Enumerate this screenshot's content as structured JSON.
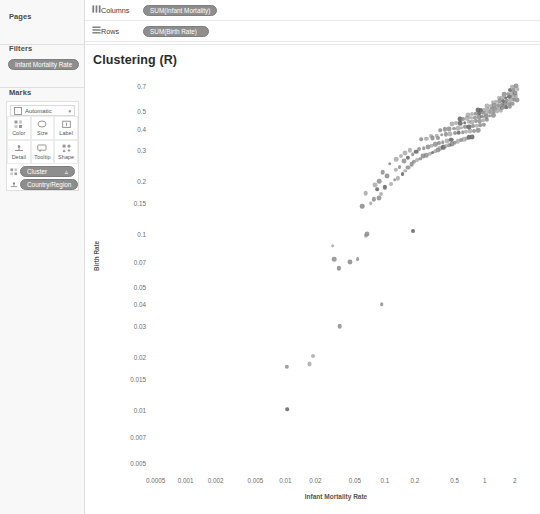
{
  "panel": {
    "pages": {
      "title": "Pages"
    },
    "filters": {
      "title": "Filters",
      "pill": "Infant Mortality Rate"
    },
    "marks": {
      "title": "Marks",
      "type": "Automatic",
      "caret": "▾",
      "buttons": [
        {
          "name": "color",
          "label": "Color",
          "icon": "color-icon"
        },
        {
          "name": "size",
          "label": "Size",
          "icon": "size-icon"
        },
        {
          "name": "label",
          "label": "Label",
          "icon": "label-icon"
        },
        {
          "name": "detail",
          "label": "Detail",
          "icon": "detail-icon"
        },
        {
          "name": "tooltip",
          "label": "Tooltip",
          "icon": "tooltip-icon"
        },
        {
          "name": "shape",
          "label": "Shape",
          "icon": "shape-icon"
        }
      ],
      "encodings": [
        {
          "label": "Cluster",
          "icon": "color-icon",
          "badge": "▵"
        },
        {
          "label": "Country/Region",
          "icon": "detail-icon",
          "badge": ""
        }
      ]
    }
  },
  "shelves": {
    "columns": {
      "label": "Columns",
      "icon": "columns-icon",
      "pill": "SUM(Infant Mortality)"
    },
    "rows": {
      "label": "Rows",
      "icon": "rows-icon",
      "pill": "SUM(Birth Rate)"
    }
  },
  "viz": {
    "title": "Clustering (R)"
  },
  "colors": {
    "pill": "#8e8e8e",
    "point": "#8a8a8a",
    "point_dark": "#5e5e5e",
    "panel": "#f8f8f8"
  },
  "chart_data": {
    "type": "scatter",
    "title": "Clustering (R)",
    "xlabel": "Infant Mortality Rate",
    "ylabel": "Birth Rate",
    "xscale": "log",
    "yscale": "log",
    "xlim": [
      0.0004,
      2.6
    ],
    "ylim": [
      0.0045,
      0.85
    ],
    "grid": false,
    "legend": false,
    "xticks": [
      0.0005,
      0.001,
      0.002,
      0.005,
      0.01,
      0.02,
      0.05,
      0.1,
      0.2,
      0.5,
      1,
      2
    ],
    "xticklabels": [
      "0.0005",
      "0.001",
      "0.002",
      "0.005",
      "0.01",
      "0.02",
      "0.05",
      "0.1",
      "0.2",
      "0.5",
      "1",
      "2"
    ],
    "yticks": [
      0.7,
      0.5,
      0.4,
      0.3,
      0.2,
      0.15,
      0.1,
      0.07,
      0.05,
      0.04,
      0.03,
      0.02,
      0.015,
      0.01,
      0.007,
      0.005
    ],
    "yticklabels": [
      "0.7",
      "0.5",
      "0.4",
      "0.3",
      "0.2",
      "0.15",
      "0.1",
      "0.07",
      "0.05",
      "0.04",
      "0.03",
      "0.02",
      "0.015",
      "0.01",
      "0.007",
      "0.005"
    ],
    "points": [
      [
        0.0105,
        0.0101
      ],
      [
        0.0104,
        0.0176
      ],
      [
        0.0175,
        0.0183
      ],
      [
        0.019,
        0.0203
      ],
      [
        0.035,
        0.03
      ],
      [
        0.093,
        0.04
      ],
      [
        0.0345,
        0.064
      ],
      [
        0.045,
        0.07
      ],
      [
        0.053,
        0.072
      ],
      [
        0.031,
        0.072
      ],
      [
        0.03,
        0.086
      ],
      [
        0.064,
        0.098
      ],
      [
        0.066,
        0.1
      ],
      [
        0.19,
        0.105
      ],
      [
        0.059,
        0.145
      ],
      [
        0.072,
        0.15
      ],
      [
        0.078,
        0.158
      ],
      [
        0.087,
        0.16
      ],
      [
        0.092,
        0.17
      ],
      [
        0.064,
        0.172
      ],
      [
        0.084,
        0.18
      ],
      [
        0.1,
        0.185
      ],
      [
        0.079,
        0.19
      ],
      [
        0.115,
        0.193
      ],
      [
        0.088,
        0.2
      ],
      [
        0.125,
        0.205
      ],
      [
        0.135,
        0.208
      ],
      [
        0.105,
        0.215
      ],
      [
        0.15,
        0.22
      ],
      [
        0.095,
        0.225
      ],
      [
        0.16,
        0.23
      ],
      [
        0.128,
        0.233
      ],
      [
        0.172,
        0.24
      ],
      [
        0.14,
        0.242
      ],
      [
        0.185,
        0.25
      ],
      [
        0.112,
        0.252
      ],
      [
        0.195,
        0.258
      ],
      [
        0.155,
        0.26
      ],
      [
        0.21,
        0.265
      ],
      [
        0.13,
        0.268
      ],
      [
        0.225,
        0.27
      ],
      [
        0.17,
        0.272
      ],
      [
        0.24,
        0.278
      ],
      [
        0.145,
        0.28
      ],
      [
        0.26,
        0.282
      ],
      [
        0.19,
        0.285
      ],
      [
        0.28,
        0.288
      ],
      [
        0.16,
        0.29
      ],
      [
        0.3,
        0.292
      ],
      [
        0.205,
        0.295
      ],
      [
        0.32,
        0.298
      ],
      [
        0.178,
        0.3
      ],
      [
        0.34,
        0.302
      ],
      [
        0.22,
        0.305
      ],
      [
        0.36,
        0.308
      ],
      [
        0.245,
        0.31
      ],
      [
        0.385,
        0.312
      ],
      [
        0.27,
        0.315
      ],
      [
        0.41,
        0.318
      ],
      [
        0.295,
        0.32
      ],
      [
        0.44,
        0.322
      ],
      [
        0.32,
        0.325
      ],
      [
        0.47,
        0.328
      ],
      [
        0.35,
        0.33
      ],
      [
        0.5,
        0.332
      ],
      [
        0.38,
        0.335
      ],
      [
        0.54,
        0.338
      ],
      [
        0.42,
        0.34
      ],
      [
        0.58,
        0.342
      ],
      [
        0.46,
        0.345
      ],
      [
        0.23,
        0.348
      ],
      [
        0.26,
        0.35
      ],
      [
        0.3,
        0.352
      ],
      [
        0.34,
        0.355
      ],
      [
        0.62,
        0.348
      ],
      [
        0.66,
        0.352
      ],
      [
        0.7,
        0.356
      ],
      [
        0.75,
        0.36
      ],
      [
        0.29,
        0.362
      ],
      [
        0.33,
        0.365
      ],
      [
        0.37,
        0.368
      ],
      [
        0.41,
        0.37
      ],
      [
        0.45,
        0.372
      ],
      [
        0.5,
        0.375
      ],
      [
        0.55,
        0.378
      ],
      [
        0.6,
        0.38
      ],
      [
        0.65,
        0.382
      ],
      [
        0.72,
        0.385
      ],
      [
        0.79,
        0.388
      ],
      [
        0.86,
        0.39
      ],
      [
        0.36,
        0.392
      ],
      [
        0.4,
        0.395
      ],
      [
        0.44,
        0.398
      ],
      [
        0.49,
        0.4
      ],
      [
        0.54,
        0.402
      ],
      [
        0.59,
        0.405
      ],
      [
        0.64,
        0.408
      ],
      [
        0.7,
        0.41
      ],
      [
        0.76,
        0.412
      ],
      [
        0.83,
        0.415
      ],
      [
        0.9,
        0.418
      ],
      [
        0.98,
        0.42
      ],
      [
        0.47,
        0.425
      ],
      [
        0.52,
        0.428
      ],
      [
        0.57,
        0.43
      ],
      [
        0.63,
        0.432
      ],
      [
        0.69,
        0.435
      ],
      [
        0.75,
        0.438
      ],
      [
        0.82,
        0.44
      ],
      [
        0.89,
        0.442
      ],
      [
        0.97,
        0.445
      ],
      [
        1.05,
        0.448
      ],
      [
        0.56,
        0.452
      ],
      [
        0.61,
        0.455
      ],
      [
        0.67,
        0.458
      ],
      [
        0.73,
        0.46
      ],
      [
        0.8,
        0.462
      ],
      [
        0.87,
        0.465
      ],
      [
        0.95,
        0.468
      ],
      [
        1.03,
        0.47
      ],
      [
        1.12,
        0.472
      ],
      [
        1.22,
        0.475
      ],
      [
        0.68,
        0.48
      ],
      [
        0.74,
        0.482
      ],
      [
        0.81,
        0.485
      ],
      [
        0.88,
        0.488
      ],
      [
        0.96,
        0.49
      ],
      [
        1.04,
        0.492
      ],
      [
        1.13,
        0.495
      ],
      [
        1.23,
        0.498
      ],
      [
        1.34,
        0.5
      ],
      [
        1.45,
        0.502
      ],
      [
        0.85,
        0.508
      ],
      [
        0.92,
        0.51
      ],
      [
        1.0,
        0.512
      ],
      [
        1.09,
        0.515
      ],
      [
        1.18,
        0.518
      ],
      [
        1.28,
        0.52
      ],
      [
        1.39,
        0.522
      ],
      [
        1.51,
        0.525
      ],
      [
        1.64,
        0.528
      ],
      [
        1.78,
        0.53
      ],
      [
        1.06,
        0.538
      ],
      [
        1.15,
        0.54
      ],
      [
        1.25,
        0.542
      ],
      [
        1.36,
        0.545
      ],
      [
        1.48,
        0.548
      ],
      [
        1.6,
        0.55
      ],
      [
        1.74,
        0.552
      ],
      [
        1.89,
        0.555
      ],
      [
        1.2,
        0.565
      ],
      [
        1.3,
        0.568
      ],
      [
        1.41,
        0.57
      ],
      [
        1.53,
        0.572
      ],
      [
        1.66,
        0.575
      ],
      [
        1.8,
        0.578
      ],
      [
        1.95,
        0.58
      ],
      [
        2.1,
        0.582
      ],
      [
        1.38,
        0.595
      ],
      [
        1.5,
        0.598
      ],
      [
        1.63,
        0.6
      ],
      [
        1.77,
        0.605
      ],
      [
        1.92,
        0.608
      ],
      [
        2.08,
        0.61
      ],
      [
        1.58,
        0.625
      ],
      [
        1.72,
        0.63
      ],
      [
        1.87,
        0.635
      ],
      [
        2.03,
        0.64
      ],
      [
        1.8,
        0.66
      ],
      [
        1.96,
        0.665
      ],
      [
        2.15,
        0.67
      ],
      [
        1.9,
        0.69
      ],
      [
        2.05,
        0.695
      ]
    ]
  }
}
